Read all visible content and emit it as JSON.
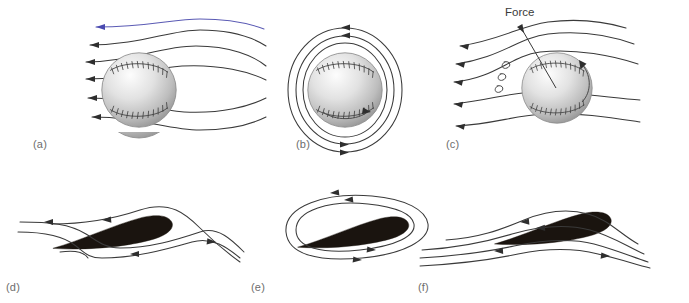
{
  "figure": {
    "title_visible": false,
    "background": "#ffffff",
    "panels": [
      {
        "id": "a",
        "label": "(a)",
        "label_x": 33,
        "label_y": 138,
        "caption_semantic": "uniform-flow-past-nonspinning-ball",
        "streamline_count": 6,
        "arrow_direction": "left",
        "object": "baseball"
      },
      {
        "id": "b",
        "label": "(b)",
        "label_x": 296,
        "label_y": 138,
        "caption_semantic": "pure-circulation-around-spinning-ball",
        "streamline_count": 3,
        "arrow_direction": "clockwise",
        "object": "baseball"
      },
      {
        "id": "c",
        "label": "(c)",
        "label_x": 446,
        "label_y": 138,
        "caption_semantic": "superposed-flow-magnus-force-on-ball",
        "streamline_count": 5,
        "arrow_direction": "left-deflected",
        "object": "baseball"
      },
      {
        "id": "d",
        "label": "(d)",
        "label_x": 6,
        "label_y": 281,
        "caption_semantic": "uniform-flow-past-airfoil-no-circulation",
        "streamline_count": 4,
        "arrow_direction": "left",
        "object": "airfoil"
      },
      {
        "id": "e",
        "label": "(e)",
        "label_x": 251,
        "label_y": 281,
        "caption_semantic": "pure-circulation-around-airfoil",
        "streamline_count": 2,
        "arrow_direction": "clockwise",
        "object": "airfoil"
      },
      {
        "id": "f",
        "label": "(f)",
        "label_x": 418,
        "label_y": 281,
        "caption_semantic": "superposed-flow-lift-on-airfoil",
        "streamline_count": 4,
        "arrow_direction": "left",
        "object": "airfoil"
      }
    ],
    "annotations": [
      {
        "name": "force-label",
        "text": "Force",
        "x": 505,
        "y": 6,
        "points_to": "ball-center-panel-c"
      }
    ],
    "colors": {
      "streamline": "#3a3a3a",
      "streamline_highlight": "#5a5ab4",
      "ball_fill_light": "#f2f2f2",
      "ball_fill_dark": "#a8a8a8",
      "airfoil": "#1a140f",
      "label_text": "#6d6d6d",
      "annotation_text": "#3a3a3a"
    },
    "eddies": {
      "name": "turbulence-curls",
      "panel": "c",
      "count": 3,
      "x": 500,
      "y": 60
    }
  }
}
